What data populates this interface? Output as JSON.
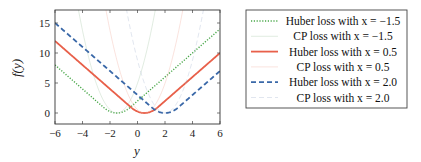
{
  "chart_data": {
    "type": "line",
    "title": "",
    "xlabel": "y",
    "ylabel": "f(y)",
    "xlim": [
      -6,
      6
    ],
    "ylim": [
      -1.5,
      17
    ],
    "xticks": [
      -6,
      -4,
      -2,
      0,
      2,
      4,
      6
    ],
    "xtick_labels": [
      "−6",
      "−4",
      "−2",
      "0",
      "2",
      "4",
      "6"
    ],
    "yticks": [
      0,
      5,
      10,
      15
    ],
    "ytick_labels": [
      "0",
      "5",
      "10",
      "15"
    ],
    "grid": false,
    "legend_position": "outside right",
    "series": [
      {
        "name": "Huber loss with x = −1.5",
        "kind": "huber",
        "x0": -1.5,
        "delta": 1.0,
        "color": "#4aa84a",
        "style": "dotted",
        "width": 1.4,
        "opacity": 1.0
      },
      {
        "name": "CP loss with x = −1.5",
        "kind": "cp",
        "x0": -1.5,
        "color": "#a8c8a8",
        "style": "solid",
        "width": 1.0,
        "opacity": 0.35
      },
      {
        "name": "Huber loss with x = 0.5",
        "kind": "huber",
        "x0": 0.5,
        "delta": 1.0,
        "color": "#e8604a",
        "style": "solid",
        "width": 1.8,
        "opacity": 1.0
      },
      {
        "name": "CP loss with x = 0.5",
        "kind": "cp",
        "x0": 0.5,
        "color": "#f0b0a0",
        "style": "solid",
        "width": 1.0,
        "opacity": 0.35
      },
      {
        "name": "Huber loss with x = 2.0",
        "kind": "huber",
        "x0": 2.0,
        "delta": 1.0,
        "color": "#3a68a8",
        "style": "dashed",
        "width": 1.8,
        "opacity": 1.0
      },
      {
        "name": "CP loss with x = 2.0",
        "kind": "cp",
        "x0": 2.0,
        "color": "#a8b8d0",
        "style": "dashed",
        "width": 1.0,
        "opacity": 0.35
      }
    ],
    "legend": {
      "entries": [
        {
          "label": "Huber loss with x = −1.5"
        },
        {
          "label": "CP loss with x = −1.5"
        },
        {
          "label": "Huber loss with x = 0.5"
        },
        {
          "label": "CP loss with x = 0.5"
        },
        {
          "label": "Huber loss with x = 2.0"
        },
        {
          "label": "CP loss with x = 2.0"
        }
      ]
    }
  }
}
